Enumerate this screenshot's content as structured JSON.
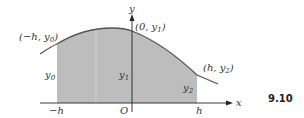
{
  "figure": {
    "number": "9.10",
    "axes": {
      "x_label": "x",
      "y_label": "y",
      "origin_label": "O"
    },
    "tick_labels": {
      "neg_h": "−h",
      "pos_h": "h"
    },
    "points": [
      {
        "label": "(−h, y0)",
        "text": "(−h, y",
        "sub": "0",
        "close": ")"
      },
      {
        "label": "(0, y1)",
        "text": "(0, y",
        "sub": "1",
        "close": ")"
      },
      {
        "label": "(h, y2)",
        "text": "(h, y",
        "sub": "2",
        "close": ")"
      }
    ],
    "ordinates": [
      {
        "label": "y0",
        "base": "y",
        "sub": "0"
      },
      {
        "label": "y1",
        "base": "y",
        "sub": "1"
      },
      {
        "label": "y2",
        "base": "y",
        "sub": "2"
      }
    ],
    "colors": {
      "fill": "#bdbdbd",
      "stroke": "#555555",
      "axis": "#222222"
    }
  }
}
